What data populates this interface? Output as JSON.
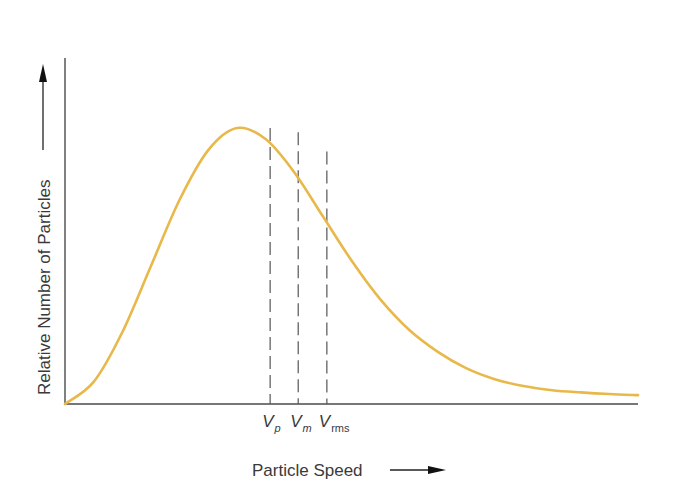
{
  "chart_data": {
    "type": "line",
    "title": "",
    "xlabel": "Particle Speed",
    "ylabel": "Relative Number of Particles",
    "x_arrow": true,
    "y_arrow": true,
    "grid": false,
    "ticks": false,
    "distribution": "Maxwell-Boltzmann speed distribution",
    "series": [
      {
        "name": "distribution",
        "color": "#e8b84a",
        "x": [
          0,
          0.05,
          0.1,
          0.15,
          0.2,
          0.25,
          0.3,
          0.35,
          0.4,
          0.45,
          0.5,
          0.55,
          0.6,
          0.65,
          0.7,
          0.75,
          0.8,
          0.85,
          0.9,
          0.95,
          1.0
        ],
        "y": [
          0,
          0.08,
          0.26,
          0.5,
          0.74,
          0.92,
          1.0,
          0.96,
          0.84,
          0.68,
          0.52,
          0.38,
          0.27,
          0.19,
          0.13,
          0.09,
          0.065,
          0.05,
          0.042,
          0.036,
          0.032
        ]
      }
    ],
    "markers": [
      {
        "main": "V",
        "sub": "p",
        "sub_italic": true,
        "x": 0.358,
        "y": 1.0
      },
      {
        "main": "V",
        "sub": "m",
        "sub_italic": true,
        "x": 0.407,
        "y": 0.985
      },
      {
        "main": "V",
        "sub": "rms",
        "sub_italic": false,
        "x": 0.457,
        "y": 0.915
      }
    ],
    "xlim": [
      0,
      1
    ],
    "ylim": [
      0,
      1.25
    ]
  },
  "colors": {
    "curve": "#e8b84a",
    "axis": "#4a4a4a",
    "text": "#3a3a3a"
  }
}
